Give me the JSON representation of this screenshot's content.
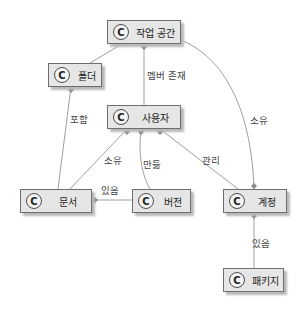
{
  "diagram": {
    "type": "class-diagram",
    "stereotype_icon": "C",
    "nodes": {
      "workspace": "작업 공간",
      "folder": "폴더",
      "user": "사용자",
      "document": "문서",
      "version": "버전",
      "account": "계정",
      "package": "패키지"
    },
    "edges": {
      "workspace_folder": "",
      "workspace_user": "멤버 존재",
      "workspace_account": "소유",
      "folder_document": "포함",
      "user_document": "소유",
      "user_version": "만듦",
      "user_account": "관리",
      "document_version": "있음",
      "account_package": "있음"
    },
    "colors": {
      "node_fill": "#e6e6e6",
      "node_border": "#6e6e6e",
      "edge": "#9a9a9a"
    }
  }
}
